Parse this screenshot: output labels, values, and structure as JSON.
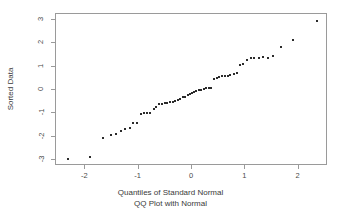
{
  "chart_data": {
    "type": "scatter",
    "title": "",
    "xlabel": "Quantiles of Standard Normal",
    "subtitle": "QQ Plot with Normal",
    "ylabel": "Sorted Data",
    "xlim": [
      -2.55,
      2.55
    ],
    "ylim": [
      -3.25,
      3.25
    ],
    "xticks": [
      -2,
      -1,
      0,
      1,
      2
    ],
    "xticklabels": [
      "-2",
      "-1",
      "0",
      "1",
      "2"
    ],
    "yticks": [
      -3,
      -2,
      -1,
      0,
      1,
      2,
      3
    ],
    "yticklabels": [
      "-3",
      "-2",
      "-1",
      "0",
      "1",
      "2",
      "3"
    ],
    "grid": false,
    "legend": false,
    "marker": "square",
    "marker_color": "#2b2b2b",
    "frame_color": "#9a9a9a",
    "background": "#ffffff",
    "n_points": 58,
    "points": [
      [
        -2.33,
        -2.95
      ],
      [
        -1.91,
        -2.85
      ],
      [
        -1.66,
        -2.05
      ],
      [
        -1.52,
        -1.92
      ],
      [
        -1.42,
        -1.88
      ],
      [
        -1.33,
        -1.75
      ],
      [
        -1.25,
        -1.68
      ],
      [
        -1.17,
        -1.62
      ],
      [
        -1.1,
        -1.42
      ],
      [
        -1.03,
        -1.4
      ],
      [
        -0.96,
        -1.02
      ],
      [
        -0.9,
        -1.0
      ],
      [
        -0.84,
        -0.99
      ],
      [
        -0.78,
        -0.97
      ],
      [
        -0.72,
        -0.8
      ],
      [
        -0.67,
        -0.72
      ],
      [
        -0.61,
        -0.62
      ],
      [
        -0.56,
        -0.58
      ],
      [
        -0.51,
        -0.55
      ],
      [
        -0.46,
        -0.54
      ],
      [
        -0.41,
        -0.52
      ],
      [
        -0.36,
        -0.5
      ],
      [
        -0.31,
        -0.46
      ],
      [
        -0.27,
        -0.42
      ],
      [
        -0.22,
        -0.38
      ],
      [
        -0.17,
        -0.32
      ],
      [
        -0.13,
        -0.28
      ],
      [
        -0.08,
        -0.22
      ],
      [
        -0.04,
        -0.18
      ],
      [
        0.0,
        -0.14
      ],
      [
        0.04,
        -0.1
      ],
      [
        0.08,
        -0.06
      ],
      [
        0.13,
        -0.02
      ],
      [
        0.17,
        0.02
      ],
      [
        0.22,
        0.06
      ],
      [
        0.27,
        0.08
      ],
      [
        0.31,
        0.09
      ],
      [
        0.36,
        0.1
      ],
      [
        0.41,
        0.45
      ],
      [
        0.46,
        0.52
      ],
      [
        0.51,
        0.55
      ],
      [
        0.56,
        0.58
      ],
      [
        0.61,
        0.6
      ],
      [
        0.67,
        0.62
      ],
      [
        0.72,
        0.65
      ],
      [
        0.78,
        0.68
      ],
      [
        0.84,
        0.72
      ],
      [
        0.9,
        1.05
      ],
      [
        0.96,
        1.1
      ],
      [
        1.03,
        1.3
      ],
      [
        1.1,
        1.35
      ],
      [
        1.17,
        1.38
      ],
      [
        1.25,
        1.37
      ],
      [
        1.33,
        1.4
      ],
      [
        1.42,
        1.38
      ],
      [
        1.52,
        1.45
      ],
      [
        1.66,
        1.82
      ],
      [
        1.89,
        2.14
      ],
      [
        2.35,
        2.95
      ]
    ]
  }
}
